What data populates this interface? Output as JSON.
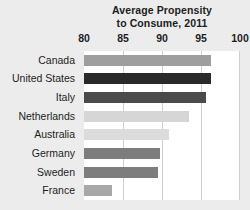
{
  "chart_data": {
    "type": "bar",
    "orientation": "horizontal",
    "title": "Average Propensity to Consume, 2011",
    "title_lines": [
      "Average Propensity",
      "to Consume, 2011"
    ],
    "xlabel": "",
    "ylabel": "",
    "xlim": [
      80,
      100
    ],
    "xticks": [
      80,
      85,
      90,
      95,
      100
    ],
    "xtick_labels": [
      "80",
      "85",
      "90",
      "95",
      "100"
    ],
    "grid": "vertical",
    "legend": "none",
    "categories": [
      "Canada",
      "United States",
      "Italy",
      "Netherlands",
      "Australia",
      "Germany",
      "Sweden",
      "France"
    ],
    "values": [
      96.3,
      96.3,
      95.7,
      93.4,
      90.9,
      89.8,
      89.5,
      83.6
    ],
    "bar_colors": [
      "#9e9e9e",
      "#2a2a2a",
      "#4a4a4a",
      "#d6d6d6",
      "#dcdcdc",
      "#7d7d7d",
      "#7d7d7d",
      "#a8a8a8"
    ],
    "bars": [
      {
        "category": "Canada",
        "value": 96.3,
        "color": "#9e9e9e"
      },
      {
        "category": "United States",
        "value": 96.3,
        "color": "#2a2a2a"
      },
      {
        "category": "Italy",
        "value": 95.7,
        "color": "#4a4a4a"
      },
      {
        "category": "Netherlands",
        "value": 93.4,
        "color": "#d6d6d6"
      },
      {
        "category": "Australia",
        "value": 90.9,
        "color": "#dcdcdc"
      },
      {
        "category": "Germany",
        "value": 89.8,
        "color": "#7d7d7d"
      },
      {
        "category": "Sweden",
        "value": 89.5,
        "color": "#7d7d7d"
      },
      {
        "category": "France",
        "value": 83.6,
        "color": "#a8a8a8"
      }
    ]
  },
  "style": {
    "page_background": "#ececec",
    "plot_background": "#ffffff",
    "gridline_color": "#cfcfcf",
    "text_color": "#1d1d1d"
  }
}
